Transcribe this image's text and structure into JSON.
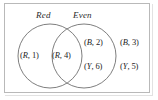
{
  "figure": {
    "type": "venn-diagram",
    "set_count": 2,
    "background_color": "#ffffff",
    "stroke_color": "#6f6f6f",
    "frame_color": "#b9b9b9"
  },
  "labels": {
    "left_set": "Red",
    "right_set": "Even"
  },
  "regions": {
    "left_only": [
      {
        "letter": "R",
        "sep": ", ",
        "number": "1",
        "open": "(",
        "close": ")"
      }
    ],
    "intersection": [
      {
        "letter": "R",
        "sep": ", ",
        "number": "4",
        "open": "(",
        "close": ")"
      }
    ],
    "right_only": [
      {
        "letter": "B",
        "sep": ", ",
        "number": "2",
        "open": "(",
        "close": ")"
      },
      {
        "letter": "Y",
        "sep": ", ",
        "number": "6",
        "open": "(",
        "close": ")"
      }
    ],
    "outside": [
      {
        "letter": "B",
        "sep": ", ",
        "number": "3",
        "open": "(",
        "close": ")"
      },
      {
        "letter": "Y",
        "sep": ", ",
        "number": "5",
        "open": "(",
        "close": ")"
      }
    ]
  },
  "text": {
    "r1_open": "(",
    "r1_letter": "R",
    "r1_sep": ", ",
    "r1_num": "1",
    "r1_close": ")",
    "r4_open": "(",
    "r4_letter": "R",
    "r4_sep": ", ",
    "r4_num": "4",
    "r4_close": ")",
    "b2_open": "(",
    "b2_letter": "B",
    "b2_sep": ", ",
    "b2_num": "2",
    "b2_close": ")",
    "y6_open": "(",
    "y6_letter": "Y",
    "y6_sep": ", ",
    "y6_num": "6",
    "y6_close": ")",
    "b3_open": "(",
    "b3_letter": "B",
    "b3_sep": ", ",
    "b3_num": "3",
    "b3_close": ")",
    "y5_open": "(",
    "y5_letter": "Y",
    "y5_sep": ", ",
    "y5_num": "5",
    "y5_close": ")"
  }
}
